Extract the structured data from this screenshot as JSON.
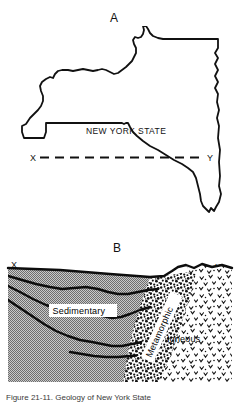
{
  "figure": {
    "panel_a_label": "A",
    "panel_b_label": "B"
  },
  "map": {
    "state_label": "NEW YORK STATE",
    "section_start_label": "X",
    "section_end_label": "Y",
    "line_style": "dashed"
  },
  "cross_section": {
    "start_label": "X",
    "end_label": "Y",
    "units": [
      {
        "name": "Sedimentary",
        "pattern": "gray-stipple",
        "boxed": true
      },
      {
        "name": "Metamorphic",
        "pattern": "dense-speckle",
        "boxed": true,
        "rotated": true
      },
      {
        "name": "Igneous",
        "pattern": "sparse-v-speckle",
        "boxed": false
      }
    ]
  },
  "caption": {
    "text": "Figure 21-11. Geology of New York State"
  },
  "colors": {
    "ink": "#111111",
    "sedimentary_fill": "#9a9a9a",
    "background": "#ffffff"
  }
}
